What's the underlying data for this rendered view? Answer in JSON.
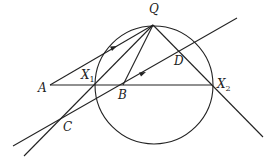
{
  "diagram": {
    "type": "geometry",
    "stroke_color": "#222222",
    "circle": {
      "cx": 154,
      "cy": 85,
      "r": 59
    },
    "points": {
      "Q": {
        "label": "Q",
        "x": 153,
        "y": 25
      },
      "A": {
        "label": "A",
        "x": 50,
        "y": 85
      },
      "X1": {
        "label": "X",
        "sub": "1",
        "x": 96,
        "y": 85
      },
      "B": {
        "label": "B",
        "x": 123,
        "y": 85
      },
      "X2": {
        "label": "X",
        "sub": "2",
        "x": 212,
        "y": 85
      },
      "C": {
        "label": "C",
        "x": 60,
        "y": 121
      },
      "D": {
        "label": "D",
        "x": 180,
        "y": 52
      }
    },
    "segments": [
      {
        "name": "A-Q",
        "arrow": true
      },
      {
        "name": "A-X2"
      },
      {
        "name": "line-through-C-X1-Q"
      },
      {
        "name": "line-through-C-B-D",
        "arrow": true
      },
      {
        "name": "Q-B"
      },
      {
        "name": "Q-X2-extended"
      }
    ]
  }
}
